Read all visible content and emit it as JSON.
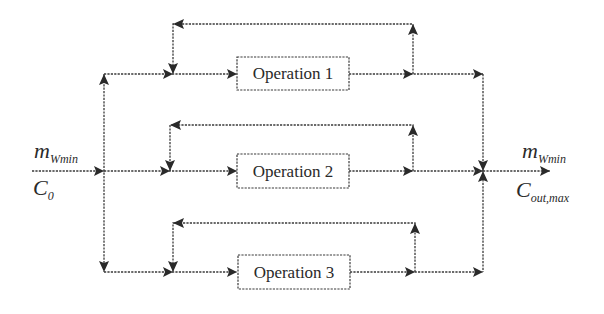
{
  "diagram": {
    "type": "parallel-operations-flow",
    "operations": [
      {
        "label": "Operation 1"
      },
      {
        "label": "Operation 2"
      },
      {
        "label": "Operation 3"
      }
    ],
    "input": {
      "flow_main": "m",
      "flow_sub": "Wmin",
      "conc_main": "C",
      "conc_sub": "0"
    },
    "output": {
      "flow_main": "m",
      "flow_sub": "Wmin",
      "conc_main": "C",
      "conc_sub": "out,max"
    },
    "colors": {
      "line": "#3a3a3a",
      "text": "#2a2a2a",
      "background": "#ffffff"
    }
  }
}
